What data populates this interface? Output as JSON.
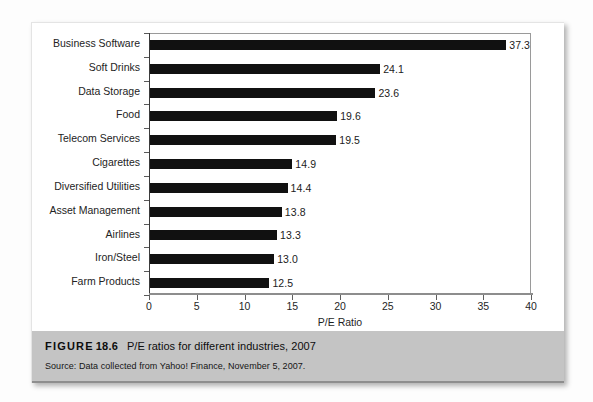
{
  "figure": {
    "label_word": "FIGURE",
    "number": "18.6",
    "title": "P/E ratios for different industries, 2007",
    "source": "Source: Data collected from Yahoo! Finance, November 5, 2007."
  },
  "chart_data": {
    "type": "bar",
    "orientation": "horizontal",
    "title": "P/E ratios for different industries, 2007",
    "xlabel": "P/E Ratio",
    "ylabel": "",
    "xlim": [
      0,
      40
    ],
    "xticks": [
      0,
      5,
      10,
      15,
      20,
      25,
      30,
      35,
      40
    ],
    "xtick_labels": [
      "0",
      "5",
      "10",
      "15",
      "20",
      "25",
      "30",
      "35",
      "40"
    ],
    "grid": false,
    "legend": null,
    "bar_color": "#111111",
    "categories": [
      "Business Software",
      "Soft Drinks",
      "Data Storage",
      "Food",
      "Telecom Services",
      "Cigarettes",
      "Diversified Utilities",
      "Asset Management",
      "Airlines",
      "Iron/Steel",
      "Farm Products"
    ],
    "values": [
      37.3,
      24.1,
      23.6,
      19.6,
      19.5,
      14.9,
      14.4,
      13.8,
      13.3,
      13.0,
      12.5
    ],
    "value_labels": [
      "37.3",
      "24.1",
      "23.6",
      "19.6",
      "19.5",
      "14.9",
      "14.4",
      "13.8",
      "13.3",
      "13.0",
      "12.5"
    ]
  }
}
